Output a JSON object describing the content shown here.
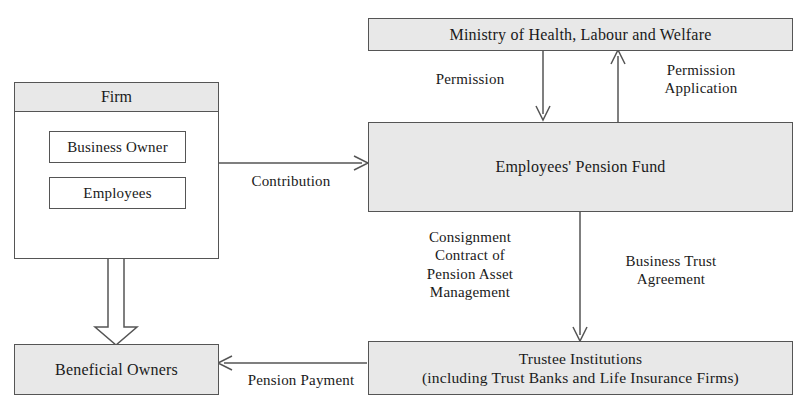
{
  "diagram": {
    "colors": {
      "node_fill": "#e8e8e8",
      "node_fill_plain": "#ffffff",
      "stroke": "#555555",
      "text": "#1a1a1a",
      "background": "#ffffff"
    },
    "nodes": [
      {
        "id": "ministry",
        "label": "Ministry of Health, Labour and Welfare",
        "fill": "shaded"
      },
      {
        "id": "firm",
        "label": "Firm",
        "fill": "shaded-header"
      },
      {
        "id": "business_owner",
        "label": "Business Owner",
        "fill": "plain"
      },
      {
        "id": "employees",
        "label": "Employees",
        "fill": "plain"
      },
      {
        "id": "epf",
        "label": "Employees' Pension Fund",
        "fill": "shaded"
      },
      {
        "id": "trustee_line1",
        "label": "Trustee Institutions",
        "fill": "shaded"
      },
      {
        "id": "trustee_line2",
        "label": "(including Trust Banks and Life Insurance Firms)",
        "fill": "shaded"
      },
      {
        "id": "beneficial_owners",
        "label": "Beneficial Owners",
        "fill": "shaded"
      }
    ],
    "edges": [
      {
        "id": "permission",
        "label": "Permission",
        "from": "ministry",
        "to": "epf",
        "arrow": "solid-down"
      },
      {
        "id": "permission_application",
        "label": "Permission\nApplication",
        "from": "epf",
        "to": "ministry",
        "arrow": "solid-up"
      },
      {
        "id": "contribution",
        "label": "Contribution",
        "from": "firm",
        "to": "epf",
        "arrow": "solid-right"
      },
      {
        "id": "consignment",
        "label": "Consignment\nContract of\nPension Asset\nManagement",
        "from": "epf",
        "to": "trustee",
        "arrow": "none"
      },
      {
        "id": "business_trust",
        "label": "Business Trust\nAgreement",
        "from": "epf",
        "to": "trustee",
        "arrow": "solid-down"
      },
      {
        "id": "pension_payment",
        "label": "Pension Payment",
        "from": "trustee",
        "to": "beneficial_owners",
        "arrow": "solid-left"
      },
      {
        "id": "firm_to_beneficial",
        "label": "",
        "from": "employees",
        "to": "beneficial_owners",
        "arrow": "hollow-down"
      }
    ]
  }
}
